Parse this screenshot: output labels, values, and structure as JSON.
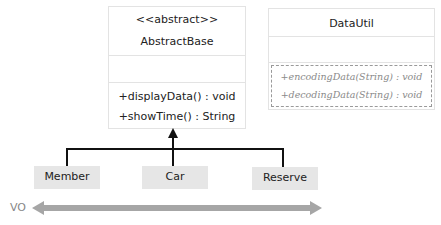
{
  "abstract_class": {
    "stereotype": "<<abstract>>",
    "name": "AbstractBase",
    "methods": [
      "+displayData() : void",
      "+showTime() : String"
    ]
  },
  "util_class": {
    "name": "DataUtil",
    "methods": [
      "+encodingData(String) : void",
      "+decodingData(String) : void"
    ]
  },
  "subclasses": [
    "Member",
    "Car",
    "Reserve"
  ],
  "vo_label": "VO",
  "colors": {
    "subclass_fill": "#e6e6e6",
    "vo_arrow": "#a6a6a6",
    "line": "#111111"
  }
}
